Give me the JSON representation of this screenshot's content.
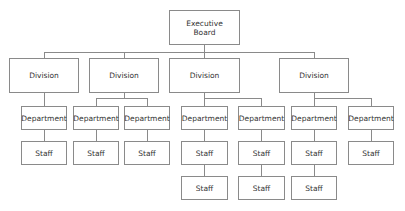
{
  "chart_data": {
    "type": "org-chart",
    "colors": {
      "line": "#8a8a8a",
      "box_border": "#8a8a8a",
      "text": "#333333",
      "background": "#ffffff"
    },
    "nodes": [
      {
        "id": "exec",
        "label": "Executive Board",
        "line1": "Executive",
        "line2": "Board",
        "x": 169,
        "y": 10,
        "w": 71,
        "h": 35
      },
      {
        "id": "div1",
        "label": "Division",
        "parent": "exec",
        "x": 9,
        "y": 58,
        "w": 70,
        "h": 35
      },
      {
        "id": "div2",
        "label": "Division",
        "parent": "exec",
        "x": 89,
        "y": 58,
        "w": 70,
        "h": 35
      },
      {
        "id": "div3",
        "label": "Division",
        "parent": "exec",
        "x": 169,
        "y": 58,
        "w": 71,
        "h": 35
      },
      {
        "id": "div4",
        "label": "Division",
        "parent": "exec",
        "x": 279,
        "y": 58,
        "w": 70,
        "h": 35
      },
      {
        "id": "dep1",
        "label": "Department",
        "parent": "div1",
        "x": 21,
        "y": 106,
        "w": 46,
        "h": 24
      },
      {
        "id": "dep2",
        "label": "Department",
        "parent": "div2",
        "x": 73,
        "y": 106,
        "w": 46,
        "h": 24
      },
      {
        "id": "dep3",
        "label": "Department",
        "parent": "div2",
        "x": 124,
        "y": 106,
        "w": 46,
        "h": 24
      },
      {
        "id": "dep4",
        "label": "Department",
        "parent": "div3",
        "x": 181,
        "y": 106,
        "w": 47,
        "h": 24
      },
      {
        "id": "dep5",
        "label": "Department",
        "parent": "div3",
        "x": 238,
        "y": 106,
        "w": 47,
        "h": 24
      },
      {
        "id": "dep6",
        "label": "Department",
        "parent": "div4",
        "x": 291,
        "y": 106,
        "w": 46,
        "h": 24
      },
      {
        "id": "dep7",
        "label": "Department",
        "parent": "div4",
        "x": 348,
        "y": 106,
        "w": 46,
        "h": 24
      },
      {
        "id": "st1",
        "label": "Staff",
        "parent": "dep1",
        "x": 21,
        "y": 141,
        "w": 46,
        "h": 24
      },
      {
        "id": "st2",
        "label": "Staff",
        "parent": "dep2",
        "x": 73,
        "y": 141,
        "w": 46,
        "h": 24
      },
      {
        "id": "st3",
        "label": "Staff",
        "parent": "dep3",
        "x": 124,
        "y": 141,
        "w": 46,
        "h": 24
      },
      {
        "id": "st4",
        "label": "Staff",
        "parent": "dep4",
        "x": 181,
        "y": 141,
        "w": 47,
        "h": 24
      },
      {
        "id": "st5",
        "label": "Staff",
        "parent": "st4",
        "x": 181,
        "y": 176,
        "w": 47,
        "h": 24
      },
      {
        "id": "st6",
        "label": "Staff",
        "parent": "dep5",
        "x": 238,
        "y": 141,
        "w": 47,
        "h": 24
      },
      {
        "id": "st7",
        "label": "Staff",
        "parent": "st6",
        "x": 238,
        "y": 176,
        "w": 47,
        "h": 24
      },
      {
        "id": "st8",
        "label": "Staff",
        "parent": "dep6",
        "x": 291,
        "y": 141,
        "w": 46,
        "h": 24
      },
      {
        "id": "st9",
        "label": "Staff",
        "parent": "st8",
        "x": 291,
        "y": 176,
        "w": 46,
        "h": 24
      },
      {
        "id": "st10",
        "label": "Staff",
        "parent": "dep7",
        "x": 348,
        "y": 141,
        "w": 46,
        "h": 24
      }
    ],
    "lines": [
      {
        "x": 204,
        "y": 45,
        "w": 1,
        "h": 7
      },
      {
        "x": 44,
        "y": 52,
        "w": 271,
        "h": 1
      },
      {
        "x": 44,
        "y": 52,
        "w": 1,
        "h": 6
      },
      {
        "x": 124,
        "y": 52,
        "w": 1,
        "h": 6
      },
      {
        "x": 204,
        "y": 52,
        "w": 1,
        "h": 6
      },
      {
        "x": 314,
        "y": 52,
        "w": 1,
        "h": 6
      },
      {
        "x": 44,
        "y": 93,
        "w": 1,
        "h": 13
      },
      {
        "x": 124,
        "y": 93,
        "w": 1,
        "h": 5
      },
      {
        "x": 96,
        "y": 98,
        "w": 52,
        "h": 1
      },
      {
        "x": 96,
        "y": 98,
        "w": 1,
        "h": 8
      },
      {
        "x": 147,
        "y": 98,
        "w": 1,
        "h": 8
      },
      {
        "x": 204,
        "y": 93,
        "w": 1,
        "h": 13
      },
      {
        "x": 204,
        "y": 98,
        "w": 58,
        "h": 1
      },
      {
        "x": 261,
        "y": 98,
        "w": 1,
        "h": 8
      },
      {
        "x": 314,
        "y": 93,
        "w": 1,
        "h": 13
      },
      {
        "x": 314,
        "y": 98,
        "w": 57,
        "h": 1
      },
      {
        "x": 371,
        "y": 98,
        "w": 1,
        "h": 8
      },
      {
        "x": 44,
        "y": 130,
        "w": 1,
        "h": 11
      },
      {
        "x": 96,
        "y": 130,
        "w": 1,
        "h": 11
      },
      {
        "x": 147,
        "y": 130,
        "w": 1,
        "h": 11
      },
      {
        "x": 204,
        "y": 130,
        "w": 1,
        "h": 11
      },
      {
        "x": 261,
        "y": 130,
        "w": 1,
        "h": 11
      },
      {
        "x": 314,
        "y": 130,
        "w": 1,
        "h": 11
      },
      {
        "x": 371,
        "y": 130,
        "w": 1,
        "h": 11
      },
      {
        "x": 204,
        "y": 165,
        "w": 1,
        "h": 11
      },
      {
        "x": 261,
        "y": 165,
        "w": 1,
        "h": 11
      },
      {
        "x": 314,
        "y": 165,
        "w": 1,
        "h": 11
      }
    ]
  }
}
